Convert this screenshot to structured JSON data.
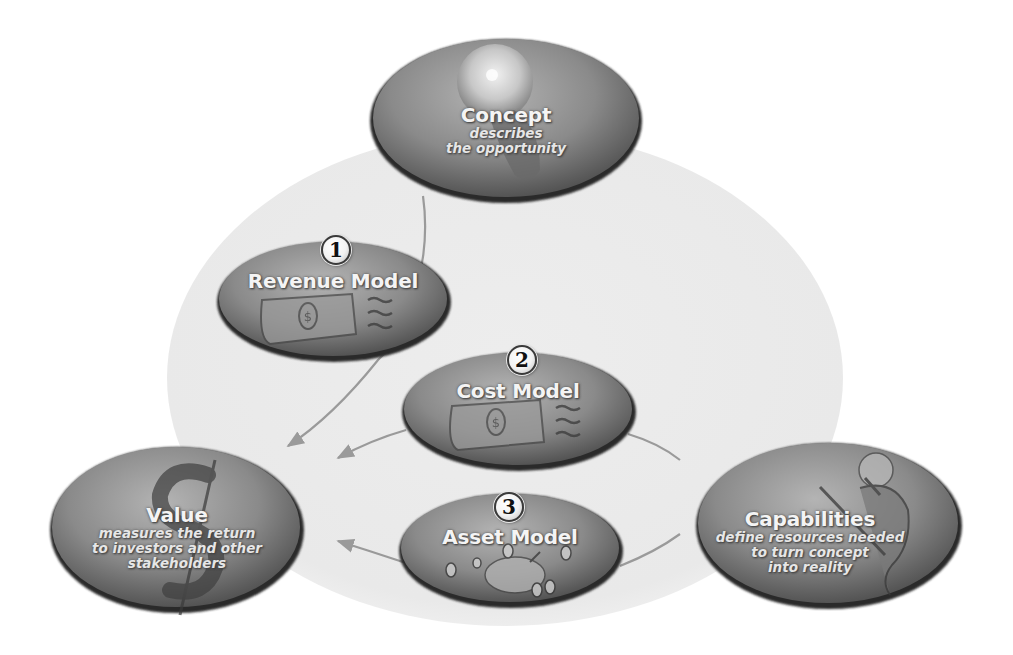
{
  "diagram": {
    "colors": {
      "background_circle": "#ececec",
      "node_fill_dark": "#6e6e6e",
      "node_fill_light": "#a8a8a8",
      "node_rim": "#2a2a2a",
      "arrow": "#9a9a9a",
      "label_text": "#f4f4f4"
    },
    "nodes": {
      "concept": {
        "title": "Concept",
        "subtitle_lines": [
          "describes",
          "the opportunity"
        ],
        "icon": "lightbulb-icon"
      },
      "revenue_model": {
        "step": "1",
        "title": "Revenue Model",
        "icon": "dollar-bill-icon"
      },
      "cost_model": {
        "step": "2",
        "title": "Cost Model",
        "icon": "dollar-bill-icon"
      },
      "asset_model": {
        "step": "3",
        "title": "Asset Model",
        "icon": "piggy-bank-icon"
      },
      "value": {
        "title": "Value",
        "subtitle_lines": [
          "measures the return",
          "to investors and other",
          "stakeholders"
        ],
        "icon": "dollar-sign-icon"
      },
      "capabilities": {
        "title": "Capabilities",
        "subtitle_lines": [
          "define resources needed",
          "to turn concept",
          "into reality"
        ],
        "icon": "worker-figure-icon"
      }
    },
    "edges": [
      {
        "from": "concept",
        "to": "value",
        "via": "revenue_model"
      },
      {
        "from": "cost_model",
        "to": "value"
      },
      {
        "from": "asset_model",
        "to": "value"
      },
      {
        "from": "capabilities",
        "to": "cost_model"
      },
      {
        "from": "capabilities",
        "to": "asset_model"
      }
    ]
  }
}
